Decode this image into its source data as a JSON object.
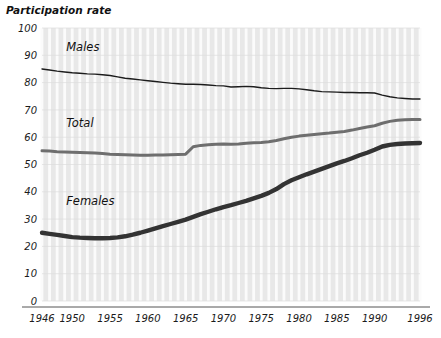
{
  "chart_data": {
    "type": "line",
    "title": "Participation rate",
    "xlabel": "",
    "ylabel": "",
    "ylim": [
      0,
      100
    ],
    "xlim": [
      1946,
      1996
    ],
    "grid": "vertical-white-bands-on-gray",
    "legend": "inline-series-labels",
    "ytick_labels": [
      "0",
      "10",
      "20",
      "30",
      "40",
      "50",
      "60",
      "70",
      "80",
      "90",
      "100"
    ],
    "ytick_values": [
      0,
      10,
      20,
      30,
      40,
      50,
      60,
      70,
      80,
      90,
      100
    ],
    "xtick_labels": [
      "1946",
      "1950",
      "1955",
      "1960",
      "1965",
      "1970",
      "1975",
      "1980",
      "1985",
      "1990",
      "1996"
    ],
    "xtick_values": [
      1946,
      1950,
      1955,
      1960,
      1965,
      1970,
      1975,
      1980,
      1985,
      1990,
      1996
    ],
    "x": [
      1946,
      1947,
      1948,
      1949,
      1950,
      1951,
      1952,
      1953,
      1954,
      1955,
      1956,
      1957,
      1958,
      1959,
      1960,
      1961,
      1962,
      1963,
      1964,
      1965,
      1966,
      1967,
      1968,
      1969,
      1970,
      1971,
      1972,
      1973,
      1974,
      1975,
      1976,
      1977,
      1978,
      1979,
      1980,
      1981,
      1982,
      1983,
      1984,
      1985,
      1986,
      1987,
      1988,
      1989,
      1990,
      1991,
      1992,
      1993,
      1994,
      1995,
      1996
    ],
    "series": [
      {
        "name": "Males",
        "label": "Males",
        "color": "#1c1c1c",
        "width": 1.4,
        "label_x": 1949.2,
        "label_y": 91.5,
        "values": [
          85.0,
          84.6,
          84.2,
          83.9,
          83.6,
          83.4,
          83.2,
          83.1,
          82.9,
          82.6,
          82.1,
          81.6,
          81.3,
          81.0,
          80.7,
          80.4,
          80.1,
          79.8,
          79.6,
          79.4,
          79.4,
          79.3,
          79.1,
          78.9,
          78.8,
          78.4,
          78.5,
          78.6,
          78.5,
          78.1,
          77.9,
          77.8,
          77.9,
          77.9,
          77.7,
          77.4,
          77.0,
          76.7,
          76.6,
          76.5,
          76.4,
          76.4,
          76.3,
          76.3,
          76.2,
          75.4,
          74.8,
          74.4,
          74.2,
          74.0,
          74.0
        ]
      },
      {
        "name": "Total",
        "label": "Total",
        "color": "#6e6e6e",
        "width": 3.0,
        "label_x": 1949.2,
        "label_y": 63.8,
        "values": [
          55.0,
          54.9,
          54.7,
          54.6,
          54.5,
          54.4,
          54.3,
          54.2,
          54.0,
          53.8,
          53.7,
          53.6,
          53.5,
          53.4,
          53.4,
          53.5,
          53.5,
          53.6,
          53.7,
          53.8,
          56.5,
          57.0,
          57.2,
          57.4,
          57.5,
          57.4,
          57.5,
          57.8,
          58.0,
          58.1,
          58.3,
          58.8,
          59.4,
          60.0,
          60.4,
          60.7,
          61.0,
          61.3,
          61.5,
          61.8,
          62.1,
          62.6,
          63.2,
          63.7,
          64.2,
          65.1,
          65.8,
          66.2,
          66.4,
          66.5,
          66.5
        ]
      },
      {
        "name": "Females",
        "label": "Females",
        "color": "#333333",
        "width": 4.4,
        "label_x": 1949.2,
        "label_y": 35.0,
        "values": [
          25.0,
          24.6,
          24.2,
          23.8,
          23.4,
          23.2,
          23.1,
          23.0,
          23.0,
          23.1,
          23.3,
          23.7,
          24.3,
          25.0,
          25.8,
          26.6,
          27.4,
          28.2,
          29.0,
          29.8,
          30.8,
          31.8,
          32.7,
          33.6,
          34.4,
          35.1,
          35.9,
          36.7,
          37.6,
          38.5,
          39.6,
          41.0,
          42.8,
          44.2,
          45.3,
          46.4,
          47.4,
          48.4,
          49.4,
          50.4,
          51.3,
          52.3,
          53.4,
          54.3,
          55.4,
          56.6,
          57.2,
          57.5,
          57.7,
          57.8,
          57.9
        ]
      }
    ]
  }
}
